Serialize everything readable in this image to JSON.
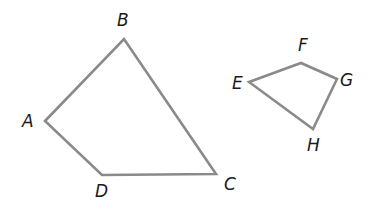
{
  "diagram": {
    "type": "two-quadrilaterals",
    "stroke_color": "#8a8a8a",
    "label_color": "#1a1a1a",
    "shapes": [
      {
        "name": "ABCD",
        "vertices": [
          {
            "label": "A",
            "x": 45,
            "y": 121,
            "label_x": 22,
            "label_y": 127
          },
          {
            "label": "B",
            "x": 124,
            "y": 39,
            "label_x": 117,
            "label_y": 26
          },
          {
            "label": "C",
            "x": 216,
            "y": 174,
            "label_x": 224,
            "label_y": 190
          },
          {
            "label": "D",
            "x": 102,
            "y": 175,
            "label_x": 95,
            "label_y": 197
          }
        ]
      },
      {
        "name": "EFGH",
        "vertices": [
          {
            "label": "E",
            "x": 249,
            "y": 82,
            "label_x": 232,
            "label_y": 89
          },
          {
            "label": "F",
            "x": 301,
            "y": 63,
            "label_x": 298,
            "label_y": 51
          },
          {
            "label": "G",
            "x": 337,
            "y": 79,
            "label_x": 340,
            "label_y": 86
          },
          {
            "label": "H",
            "x": 313,
            "y": 129,
            "label_x": 307,
            "label_y": 151
          }
        ]
      }
    ]
  },
  "labels": {
    "A": "A",
    "B": "B",
    "C": "C",
    "D": "D",
    "E": "E",
    "F": "F",
    "G": "G",
    "H": "H"
  }
}
